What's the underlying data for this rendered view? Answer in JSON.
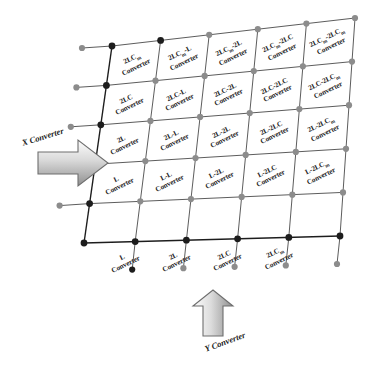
{
  "figure": {
    "type": "grid-diagram",
    "rows": 5,
    "cols": 5,
    "colors": {
      "grid_line": "#4a4a4a",
      "node_dark": "#1d1d1d",
      "node_grey": "#8c8c8c",
      "arrow_fill": "#b9b9b9",
      "arrow_stroke": "#6e6e6e",
      "text": "#1b1b1b",
      "background": "#ffffff"
    }
  },
  "axes": {
    "x": {
      "label": "X Converter",
      "direction": "right",
      "arrow": "arrow-right-icon"
    },
    "y": {
      "label": "Y Converter",
      "direction": "up",
      "arrow": "arrow-up-icon"
    }
  },
  "suffix": "Converter",
  "grid": {
    "row_headers": [
      "2LCm",
      "2LC",
      "2L",
      "L"
    ],
    "col_headers": [
      "L",
      "2L",
      "2LC",
      "2LCm"
    ],
    "rows": [
      {
        "row_index": 0,
        "cells": [
          {
            "name": "2LC",
            "sub": "m",
            "line1": "2LC",
            "line2": "Converter"
          },
          {
            "name": "2LCm-L",
            "line1": "2LC",
            "sub": "m",
            "tail": "-L",
            "line2": "Converter"
          },
          {
            "name": "2LCm-2L",
            "line1": "2LC",
            "sub": "m",
            "tail": "-2L",
            "line2": "Converter"
          },
          {
            "name": "2LCm-2LC",
            "line1": "2LC",
            "sub": "m",
            "tail": "-2LC",
            "line2": "Converter"
          },
          {
            "name": "2LCm-2LCm",
            "line1": "2LC",
            "sub": "m",
            "tail": "-2LC",
            "sub2": "m",
            "line2": "Converter"
          }
        ]
      },
      {
        "row_index": 1,
        "cells": [
          {
            "name": "2LC",
            "line1": "2LC",
            "line2": "Converter"
          },
          {
            "name": "2LC-L",
            "line1": "2LC-L",
            "line2": "Converter"
          },
          {
            "name": "2LC-2L",
            "line1": "2LC-2L",
            "line2": "Converter"
          },
          {
            "name": "2LC-2LC",
            "line1": "2LC-2LC",
            "line2": "Converter"
          },
          {
            "name": "2LC-2LCm",
            "line1": "2LC-2LC",
            "sub2": "m",
            "line2": "Converter"
          }
        ]
      },
      {
        "row_index": 2,
        "cells": [
          {
            "name": "2L",
            "line1": "2L",
            "line2": "Converter"
          },
          {
            "name": "2L-L",
            "line1": "2L-L",
            "line2": "Converter"
          },
          {
            "name": "2L-2L",
            "line1": "2L-2L",
            "line2": "Converter"
          },
          {
            "name": "2L-2LC",
            "line1": "2L-2LC",
            "line2": "Converter"
          },
          {
            "name": "2L-2LCm",
            "line1": "2L-2LC",
            "sub2": "m",
            "line2": "Converter"
          }
        ]
      },
      {
        "row_index": 3,
        "cells": [
          {
            "name": "L",
            "line1": "L",
            "line2": "Converter"
          },
          {
            "name": "L-L",
            "line1": "L-L",
            "line2": "Converter"
          },
          {
            "name": "L-2L",
            "line1": "L-2L",
            "line2": "Converter"
          },
          {
            "name": "L-2LC",
            "line1": "L-2LC",
            "line2": "Converter"
          },
          {
            "name": "L-2LCm",
            "line1": "L-2LC",
            "sub2": "m",
            "line2": "Converter"
          }
        ]
      },
      {
        "row_index": 4,
        "cells": [
          {
            "name": "L",
            "line1": "L",
            "line2": "Converter"
          },
          {
            "name": "2L",
            "line1": "2L",
            "line2": "Converter"
          },
          {
            "name": "2LC",
            "line1": "2LC",
            "line2": "Converter"
          },
          {
            "name": "2LCm",
            "line1": "2LC",
            "sub2": "m",
            "line2": "Converter"
          }
        ]
      }
    ]
  }
}
